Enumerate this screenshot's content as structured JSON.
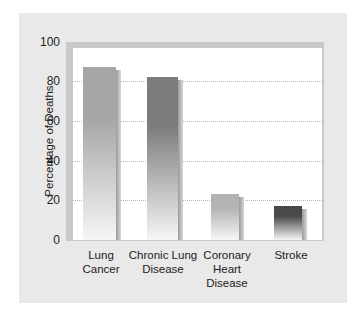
{
  "chart_data": {
    "type": "bar",
    "title": "",
    "xlabel": "",
    "ylabel": "Percentage of Deaths",
    "categories": [
      "Lung Cancer",
      "Chronic Lung Disease",
      "Coronary Heart Disease",
      "Stroke"
    ],
    "values": [
      87,
      82,
      23,
      17
    ],
    "ylim": [
      0,
      100
    ],
    "yticks": [
      0,
      20,
      40,
      60,
      80,
      100
    ],
    "grid": true,
    "legend": null
  },
  "axis": {
    "ylabel": "Percentage of Deaths",
    "ticks": [
      "100",
      "80",
      "60",
      "40",
      "20",
      "0"
    ]
  },
  "bars": [
    {
      "label_lines": [
        "Lung",
        "Cancer"
      ],
      "value": 87,
      "color": "#a6a6a6"
    },
    {
      "label_lines": [
        "Chronic Lung",
        "Disease"
      ],
      "value": 82,
      "color": "#7c7c7c"
    },
    {
      "label_lines": [
        "Coronary",
        "Heart",
        "Disease"
      ],
      "value": 23,
      "color": "#b3b3b3"
    },
    {
      "label_lines": [
        "Stroke"
      ],
      "value": 17,
      "color": "#4a4a4a"
    }
  ]
}
